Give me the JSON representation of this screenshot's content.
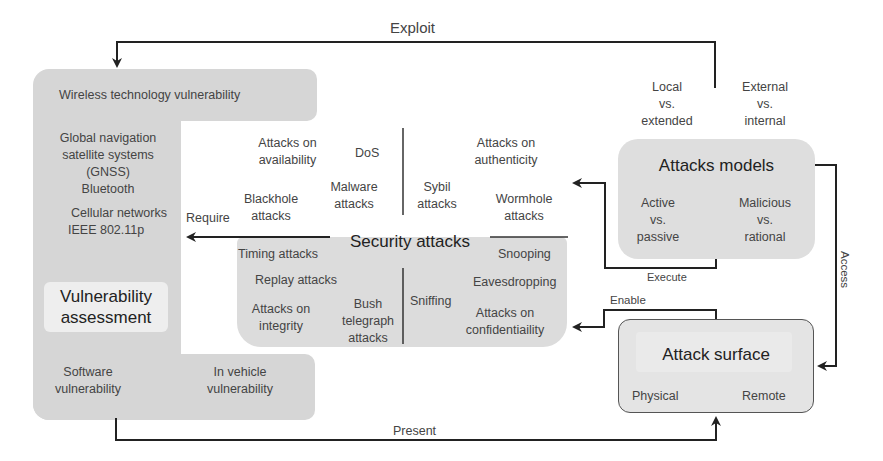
{
  "arrows": {
    "exploit": "Exploit",
    "require": "Require",
    "execute": "Execute",
    "enable": "Enable",
    "access": "Access",
    "present": "Present"
  },
  "vulnerability": {
    "wireless_header": "Wireless technology vulnerability",
    "wireless_items": [
      "Global navigation",
      "satellite systems",
      "(GNSS)",
      "Bluetooth",
      "Cellular networks",
      "IEEE 802.11p"
    ],
    "title_line1": "Vulnerability",
    "title_line2": "assessment",
    "software_line1": "Software",
    "software_line2": "vulnerability",
    "vehicle_line1": "In vehicle",
    "vehicle_line2": "vulnerability"
  },
  "security": {
    "title": "Security attacks",
    "availability": {
      "label_line1": "Attacks on",
      "label_line2": "availability",
      "dos": "DoS",
      "malware_line1": "Malware",
      "malware_line2": "attacks",
      "blackhole_line1": "Blackhole",
      "blackhole_line2": "attacks"
    },
    "authenticity": {
      "label_line1": "Attacks on",
      "label_line2": "authenticity",
      "sybil_line1": "Sybil",
      "sybil_line2": "attacks",
      "wormhole_line1": "Wormhole",
      "wormhole_line2": "attacks"
    },
    "integrity": {
      "timing": "Timing attacks",
      "replay": "Replay attacks",
      "label_line1": "Attacks on",
      "label_line2": "integrity",
      "bush_line1": "Bush",
      "bush_line2": "telegraph",
      "bush_line3": "attacks"
    },
    "confidentiality": {
      "snooping": "Snooping",
      "eavesdropping": "Eavesdropping",
      "sniffing": "Sniffing",
      "label_line1": "Attacks on",
      "label_line2": "confidentiaility"
    }
  },
  "models": {
    "title": "Attacks models",
    "local": [
      "Local",
      "vs.",
      "extended"
    ],
    "external": [
      "External",
      "vs.",
      "internal"
    ],
    "active": [
      "Active",
      "vs.",
      "passive"
    ],
    "malicious": [
      "Malicious",
      "vs.",
      "rational"
    ]
  },
  "surface": {
    "title": "Attack surface",
    "physical": "Physical",
    "remote": "Remote"
  }
}
